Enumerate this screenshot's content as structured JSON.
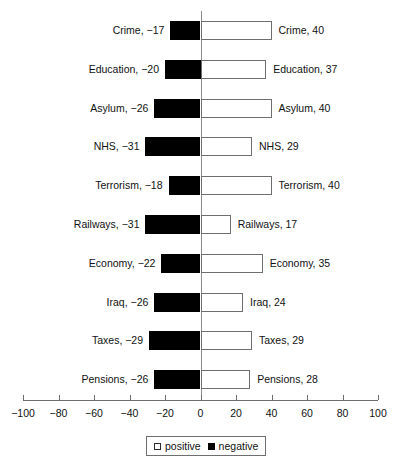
{
  "chart_data": {
    "type": "bar",
    "title": "",
    "subtitle": "",
    "xlabel": "",
    "ylabel": "",
    "orientation": "horizontal",
    "diverging": true,
    "grid": false,
    "xlim": [
      -100,
      100
    ],
    "xticks": [
      -100,
      -80,
      -60,
      -40,
      -20,
      0,
      20,
      40,
      60,
      80,
      100
    ],
    "xtick_labels": [
      "−100",
      "−80",
      "−60",
      "−40",
      "−20",
      "0",
      "20",
      "40",
      "60",
      "80",
      "100"
    ],
    "categories": [
      "Crime",
      "Education",
      "Asylum",
      "NHS",
      "Terrorism",
      "Railways",
      "Economy",
      "Iraq",
      "Taxes",
      "Pensions"
    ],
    "series": [
      {
        "name": "positive",
        "color": "#ffffff",
        "values": [
          40,
          37,
          40,
          29,
          40,
          17,
          35,
          24,
          29,
          28
        ]
      },
      {
        "name": "negative",
        "color": "#000000",
        "values": [
          -17,
          -20,
          -26,
          -31,
          -18,
          -31,
          -22,
          -26,
          -29,
          -26
        ]
      }
    ],
    "point_labels": {
      "left": [
        "Crime, −17",
        "Education, −20",
        "Asylum, −26",
        "NHS, −31",
        "Terrorism, −18",
        "Railways, −31",
        "Economy, −22",
        "Iraq, −26",
        "Taxes, −29",
        "Pensions, −26"
      ],
      "right": [
        "Crime, 40",
        "Education, 37",
        "Asylum, 40",
        "NHS, 29",
        "Terrorism, 40",
        "Railways, 17",
        "Economy, 35",
        "Iraq, 24",
        "Taxes, 29",
        "Pensions, 28"
      ]
    },
    "legend": {
      "position": "bottom",
      "entries": [
        {
          "label": "positive",
          "swatch": "positive"
        },
        {
          "label": "negative",
          "swatch": "negative"
        }
      ]
    }
  }
}
